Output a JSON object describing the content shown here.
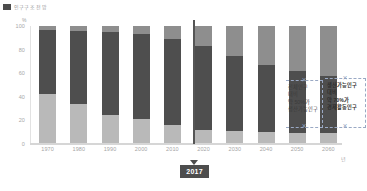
{
  "legend": {
    "swatch_color": "#4c4c4c",
    "label": "인구구조 전망"
  },
  "axis": {
    "y_unit": "%",
    "x_unit": "년",
    "y_ticks": [
      "0",
      "20",
      "40",
      "60",
      "80",
      "100"
    ],
    "y_min": 0,
    "y_max": 100
  },
  "marker": {
    "label": "2017",
    "year": 2017
  },
  "annotations": [
    {
      "id": "annotation-working-age-share",
      "lines": [
        "전체인구",
        "대비",
        "약 50%가",
        "생산가능인구"
      ],
      "bold": false
    },
    {
      "id": "annotation-economically-active-share",
      "lines": [
        "생산가능인구",
        "대비",
        "약 70%가",
        "경제활동인구"
      ],
      "bold": true
    }
  ],
  "colors": {
    "youth": "#b9b9b9",
    "working": "#4e4e4e",
    "elderly": "#8e8e8e",
    "marker": "#4d4d4d",
    "grid": "#ececec",
    "brace": "#9aa9c4"
  },
  "chart_data": {
    "type": "bar",
    "title": "인구구조 전망",
    "xlabel": "년",
    "ylabel": "%",
    "ylim": [
      0,
      100
    ],
    "grid": false,
    "legend_position": "top-left",
    "stacked": true,
    "categories": [
      "1970",
      "1980",
      "1990",
      "2000",
      "2010",
      "2020",
      "2030",
      "2040",
      "2050",
      "2060"
    ],
    "series": [
      {
        "name": "유소년인구",
        "key": "youth",
        "values": [
          42,
          34,
          25,
          21,
          16,
          12,
          11,
          10,
          9,
          9
        ]
      },
      {
        "name": "생산가능인구",
        "key": "working",
        "values": [
          55,
          62,
          70,
          72,
          73,
          71,
          64,
          57,
          53,
          49
        ]
      },
      {
        "name": "고령인구",
        "key": "elderly",
        "values": [
          3,
          4,
          5,
          7,
          11,
          17,
          25,
          33,
          38,
          42
        ]
      }
    ],
    "annotations": [
      {
        "text": "전체인구 대비 약 50%가 생산가능인구",
        "target": "working"
      },
      {
        "text": "생산가능인구 대비 약 70%가 경제활동인구",
        "target": "working"
      }
    ],
    "marker_line": {
      "value": "2017",
      "label": "2017"
    }
  }
}
